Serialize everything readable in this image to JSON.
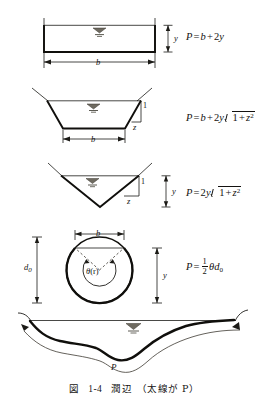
{
  "figure": {
    "caption_label": "図",
    "caption_number": "1-4",
    "caption_title": "潤辺",
    "caption_note": "（太線が P）"
  },
  "rows": [
    {
      "name": "rectangular-channel",
      "formula_lhs": "P",
      "formula_rhs": "b + 2y",
      "labels": {
        "width": "b",
        "depth": "y"
      }
    },
    {
      "name": "trapezoidal-channel",
      "formula_lhs": "P",
      "formula_rhs": "b + 2y√(1+z²)",
      "labels": {
        "width": "b",
        "slope_run": "z",
        "slope_rise": "1"
      }
    },
    {
      "name": "triangular-channel",
      "formula_lhs": "P",
      "formula_rhs": "2y√(1+z²)",
      "labels": {
        "depth": "y",
        "slope_run": "z",
        "slope_rise": "1"
      }
    },
    {
      "name": "circular-channel",
      "formula_lhs": "P",
      "formula_rhs": "½ θd₀",
      "labels": {
        "width": "b",
        "diameter": "d",
        "diameter_sub": "0",
        "depth": "y",
        "angle": "θ",
        "angle_unit": "(r)"
      }
    },
    {
      "name": "irregular-channel",
      "formula_lhs": "",
      "formula_rhs": "",
      "labels": {
        "perimeter": "P"
      }
    }
  ],
  "symbols": {
    "P": "P",
    "b": "b",
    "y": "y",
    "z": "z",
    "one": "1",
    "two": "2",
    "theta": "θ",
    "d": "d",
    "zero_sub": "0",
    "r_paren": "(r)",
    "equals": "=",
    "plus": "+"
  }
}
